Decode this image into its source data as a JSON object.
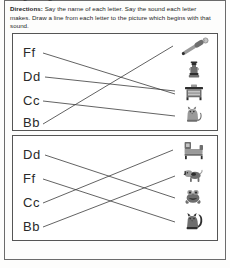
{
  "worksheet": {
    "clipped_title": "Beginning sounds: Bb, Cc, Dd, Ff",
    "directions_label": "Directions:",
    "directions_text": " Say the name of each letter. Say the sound each letter makes. Draw a line from each letter to the picture which begins with that sound."
  },
  "exercises": [
    {
      "id": "box-1",
      "letters": [
        {
          "label": "Ff",
          "y": 12
        },
        {
          "label": "Dd",
          "y": 36
        },
        {
          "label": "Cc",
          "y": 60
        },
        {
          "label": "Bb",
          "y": 82
        }
      ],
      "pictures": [
        {
          "name": "baseball-bat",
          "alt": "bat and ball",
          "y": 4
        },
        {
          "name": "fire-hydrant",
          "alt": "fire hydrant",
          "y": 28
        },
        {
          "name": "desk",
          "alt": "desk",
          "y": 50
        },
        {
          "name": "cat",
          "alt": "cat",
          "y": 72
        }
      ],
      "connections": [
        {
          "from": "Ff",
          "to": "desk"
        },
        {
          "from": "Dd",
          "to": "desk"
        },
        {
          "from": "Cc",
          "to": "cat"
        },
        {
          "from": "Bb",
          "to": "baseball-bat"
        }
      ]
    },
    {
      "id": "box-2",
      "letters": [
        {
          "label": "Dd",
          "y": 12
        },
        {
          "label": "Ff",
          "y": 36
        },
        {
          "label": "Cc",
          "y": 60
        },
        {
          "label": "Bb",
          "y": 84
        }
      ],
      "pictures": [
        {
          "name": "bed",
          "alt": "bed",
          "y": 4
        },
        {
          "name": "dog",
          "alt": "dog",
          "y": 30
        },
        {
          "name": "frog",
          "alt": "frog",
          "y": 52
        },
        {
          "name": "squirrel-cat",
          "alt": "cat",
          "y": 76
        }
      ],
      "connections": [
        {
          "from": "Dd",
          "to": "frog"
        },
        {
          "from": "Ff",
          "to": "squirrel-cat"
        },
        {
          "from": "Cc",
          "to": "bed"
        },
        {
          "from": "Bb",
          "to": "dog"
        }
      ]
    }
  ],
  "colors": {
    "ink": "#3b3b3b",
    "border": "#555555",
    "page_border": "#6b6b6b",
    "text": "#262626"
  }
}
